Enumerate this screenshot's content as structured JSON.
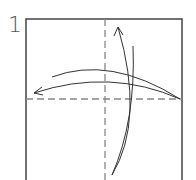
{
  "step": {
    "number": "1"
  },
  "diagram": {
    "type": "origami-fold-step",
    "paper": {
      "shape": "square",
      "fill": "#ffffff",
      "stroke": "#444444"
    },
    "creases": [
      {
        "name": "vertical-center-valley-fold",
        "style": "dashed",
        "color": "#888888"
      },
      {
        "name": "horizontal-center-valley-fold",
        "style": "dashed",
        "color": "#888888"
      }
    ],
    "arrows": [
      {
        "name": "fold-right-to-left-and-unfold",
        "direction": "right-to-left"
      },
      {
        "name": "fold-bottom-to-top-and-unfold",
        "direction": "bottom-to-top"
      }
    ],
    "line_color": "#333333"
  }
}
